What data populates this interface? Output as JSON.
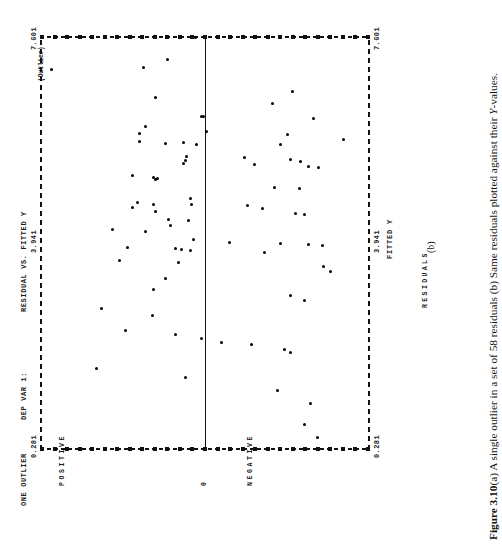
{
  "page": {
    "orientation": "rotated-90-ccw",
    "background": "#ffffff",
    "ink": "#111111"
  },
  "header": {
    "run_title": "ONE OUTLIER",
    "dep_var": "DEP VAR 1:",
    "plot_title": "RESIDUAL VS. FITTED Y"
  },
  "labels": {
    "y_axis_title": "RESIDUALS",
    "x_axis_title": "FITTED Y",
    "positive": "POSITIVE",
    "negative": "NEGATIVE",
    "zero": "0",
    "outlier_note": "(Outlier)",
    "panel_letter": "(b)"
  },
  "caption": {
    "figure_number": "Figure 3.10",
    "text": "(a)   A single outlier in a set of 58 residuals (b) Same residuals plotted against their ",
    "italic_tail": "Y",
    "text_end": "-values."
  },
  "chart_data": {
    "type": "scatter",
    "title": "RESIDUAL VS. FITTED Y",
    "xlabel": "FITTED Y",
    "ylabel": "RESIDUALS",
    "grid": false,
    "legend": "none",
    "x_ticks": [
      "0.281",
      "3.941",
      "7.601"
    ],
    "x_tick_values": [
      0.281,
      3.941,
      7.601
    ],
    "xlim": [
      0.281,
      7.601
    ],
    "y_ticks": [
      "POSITIVE",
      "0",
      "NEGATIVE"
    ],
    "ylim": [
      -1,
      1
    ],
    "zero_reference_line": 0,
    "n_points": 58,
    "marker": "+",
    "annotations": [
      {
        "text": "(Outlier)",
        "x": 7.0,
        "y": 0.93
      }
    ],
    "points": [
      {
        "x": 7.58,
        "y": 0.06
      },
      {
        "x": 7.18,
        "y": 0.23
      },
      {
        "x": 7.05,
        "y": 0.37
      },
      {
        "x": 6.62,
        "y": -0.53
      },
      {
        "x": 6.52,
        "y": 0.3
      },
      {
        "x": 6.4,
        "y": -0.41
      },
      {
        "x": 6.18,
        "y": 0.02
      },
      {
        "x": 6.17,
        "y": 0.01
      },
      {
        "x": 6.14,
        "y": -0.66
      },
      {
        "x": 6.0,
        "y": 0.36
      },
      {
        "x": 5.92,
        "y": -0.01
      },
      {
        "x": 5.88,
        "y": 0.4
      },
      {
        "x": 5.86,
        "y": -0.5
      },
      {
        "x": 5.77,
        "y": -0.84
      },
      {
        "x": 5.74,
        "y": 0.4
      },
      {
        "x": 5.72,
        "y": 0.13
      },
      {
        "x": 5.7,
        "y": 0.24
      },
      {
        "x": 5.69,
        "y": -0.46
      },
      {
        "x": 5.68,
        "y": 0.05
      },
      {
        "x": 5.47,
        "y": 0.11
      },
      {
        "x": 5.45,
        "y": -0.24
      },
      {
        "x": 5.42,
        "y": -0.52
      },
      {
        "x": 5.4,
        "y": 0.12
      },
      {
        "x": 5.38,
        "y": -0.58
      },
      {
        "x": 5.35,
        "y": 0.13
      },
      {
        "x": 5.33,
        "y": -0.3
      },
      {
        "x": 5.3,
        "y": -0.63
      },
      {
        "x": 5.27,
        "y": -0.69
      },
      {
        "x": 5.14,
        "y": 0.44
      },
      {
        "x": 5.1,
        "y": 0.31
      },
      {
        "x": 5.08,
        "y": 0.29
      },
      {
        "x": 5.07,
        "y": 0.3
      },
      {
        "x": 4.92,
        "y": -0.42
      },
      {
        "x": 4.9,
        "y": -0.57
      },
      {
        "x": 4.73,
        "y": 0.09
      },
      {
        "x": 4.66,
        "y": 0.41
      },
      {
        "x": 4.63,
        "y": 0.08
      },
      {
        "x": 4.62,
        "y": 0.31
      },
      {
        "x": 4.6,
        "y": -0.26
      },
      {
        "x": 4.57,
        "y": 0.44
      },
      {
        "x": 4.55,
        "y": -0.35
      },
      {
        "x": 4.5,
        "y": 0.3
      },
      {
        "x": 4.47,
        "y": -0.55
      },
      {
        "x": 4.44,
        "y": -0.6
      },
      {
        "x": 4.35,
        "y": 0.22
      },
      {
        "x": 4.33,
        "y": 0.1
      },
      {
        "x": 4.25,
        "y": 0.21
      },
      {
        "x": 4.18,
        "y": 0.56
      },
      {
        "x": 4.14,
        "y": 0.36
      },
      {
        "x": 4.0,
        "y": 0.07
      },
      {
        "x": 3.95,
        "y": -0.15
      },
      {
        "x": 3.93,
        "y": -0.46
      },
      {
        "x": 3.92,
        "y": -0.63
      },
      {
        "x": 3.9,
        "y": -0.71
      },
      {
        "x": 3.86,
        "y": 0.47
      },
      {
        "x": 3.84,
        "y": 0.18
      },
      {
        "x": 3.82,
        "y": 0.14
      },
      {
        "x": 3.8,
        "y": 0.09
      },
      {
        "x": 3.78,
        "y": -0.36
      },
      {
        "x": 3.63,
        "y": 0.52
      },
      {
        "x": 3.6,
        "y": 0.16
      },
      {
        "x": 3.52,
        "y": -0.72
      },
      {
        "x": 3.44,
        "y": -0.76
      },
      {
        "x": 3.32,
        "y": 0.24
      },
      {
        "x": 3.12,
        "y": 0.31
      },
      {
        "x": 3.02,
        "y": -0.52
      },
      {
        "x": 2.92,
        "y": -0.6
      },
      {
        "x": 2.78,
        "y": 0.63
      },
      {
        "x": 2.66,
        "y": 0.32
      },
      {
        "x": 2.4,
        "y": 0.48
      },
      {
        "x": 2.33,
        "y": 0.18
      },
      {
        "x": 2.26,
        "y": 0.02
      },
      {
        "x": 2.18,
        "y": -0.1
      },
      {
        "x": 2.14,
        "y": -0.28
      },
      {
        "x": 2.05,
        "y": -0.48
      },
      {
        "x": 2.01,
        "y": -0.52
      },
      {
        "x": 1.72,
        "y": 0.66
      },
      {
        "x": 1.56,
        "y": 0.12
      },
      {
        "x": 1.34,
        "y": -0.44
      },
      {
        "x": 1.1,
        "y": -0.64
      },
      {
        "x": 0.74,
        "y": -0.6
      },
      {
        "x": 0.51,
        "y": -0.68
      }
    ],
    "outlier_point": {
      "x": 7.01,
      "y": 0.93
    }
  }
}
